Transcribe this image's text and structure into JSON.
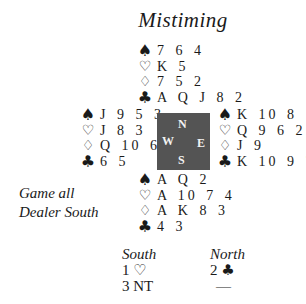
{
  "title": "Mistiming",
  "hands": {
    "north": {
      "spades": "7 6 4",
      "hearts": "K 5",
      "diamonds": "7 5 2",
      "clubs": "A Q J 8 2"
    },
    "west": {
      "spades": "J 9 5 3",
      "hearts": "J 8 3",
      "diamonds": "Q 10 6 4",
      "clubs": "6 5"
    },
    "east": {
      "spades": "K 10 8",
      "hearts": "Q 9 6 2",
      "diamonds": "J 9",
      "clubs": "K 10 9 7"
    },
    "south": {
      "spades": "A Q 2",
      "hearts": "A 10 7 4",
      "diamonds": "A K 8 3",
      "clubs": "4 3"
    }
  },
  "suit_symbols": {
    "spades": "♠",
    "hearts": "♡",
    "diamonds": "♢",
    "clubs": "♣"
  },
  "compass": {
    "north": "N",
    "west": "W",
    "east": "E",
    "south": "S",
    "color": "#545454"
  },
  "info": {
    "vulnerability": "Game all",
    "dealer": "Dealer South"
  },
  "bidding": {
    "headers": [
      "South",
      "North"
    ],
    "south": [
      {
        "level": "1",
        "suit": "♡"
      },
      {
        "level": "3",
        "suit": "NT"
      }
    ],
    "north": [
      {
        "level": "2",
        "suit": "♣"
      },
      {
        "level": "",
        "suit": "—"
      }
    ]
  }
}
